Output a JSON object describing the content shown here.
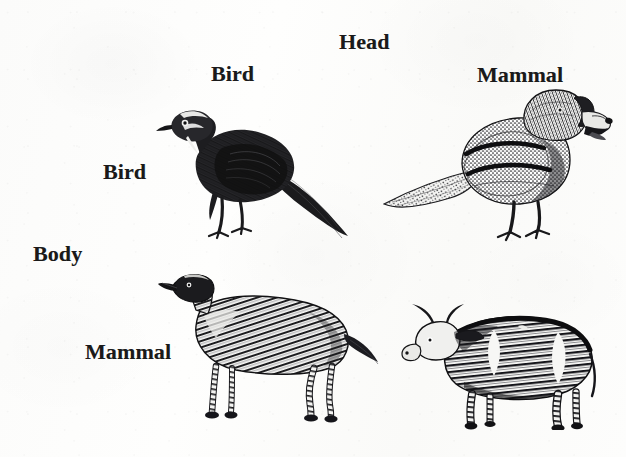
{
  "figure": {
    "type": "matrix-diagram",
    "background_color": "#fdfdfc",
    "ink_color": "#1a1a1a"
  },
  "axes": {
    "column_axis_label": "Head",
    "row_axis_label": "Body",
    "column_headers": [
      "Bird",
      "Mammal"
    ],
    "row_headers": [
      "Bird",
      "Mammal"
    ]
  },
  "cells": [
    {
      "id": "bird-head-bird-body",
      "head": "Bird",
      "body": "Bird",
      "artwork": "turkey-engraving",
      "caption": ""
    },
    {
      "id": "mammal-head-bird-body",
      "head": "Mammal",
      "body": "Bird",
      "artwork": "dog-head-pigeon-body-engraving",
      "caption": ""
    },
    {
      "id": "bird-head-mammal-body",
      "head": "Bird",
      "body": "Mammal",
      "artwork": "bird-head-dog-body-engraving",
      "caption": ""
    },
    {
      "id": "mammal-head-mammal-body",
      "head": "Mammal",
      "body": "Mammal",
      "artwork": "cow-engraving",
      "caption": ""
    }
  ]
}
